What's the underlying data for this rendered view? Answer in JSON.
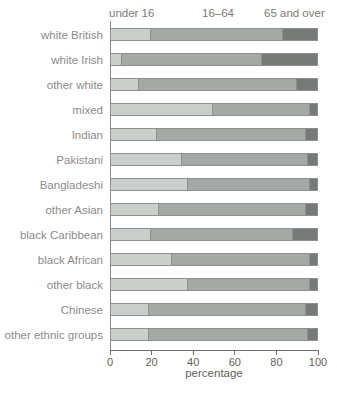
{
  "chart_data": {
    "type": "bar",
    "orientation": "horizontal",
    "stacked": true,
    "title": "",
    "xlabel": "percentage",
    "ylabel": "",
    "xlim": [
      0,
      100
    ],
    "xticks": [
      0,
      20,
      40,
      60,
      80,
      100
    ],
    "legend_position": "top",
    "grid": false,
    "categories": [
      "white British",
      "white Irish",
      "other white",
      "mixed",
      "Indian",
      "Pakistani",
      "Bangladeshi",
      "other Asian",
      "black Caribbean",
      "black African",
      "other black",
      "Chinese",
      "other ethnic groups"
    ],
    "series": [
      {
        "name": "under 16",
        "key": "under-16",
        "color": "#cbcfcb",
        "values": [
          19,
          5,
          13,
          49,
          22,
          34,
          37,
          23,
          19,
          29,
          37,
          18,
          18
        ]
      },
      {
        "name": "16–64",
        "key": "16-64",
        "color": "#a5a9a5",
        "values": [
          64,
          68,
          77,
          47,
          72,
          61,
          59,
          71,
          69,
          67,
          59,
          76,
          77
        ]
      },
      {
        "name": "65 and over",
        "key": "65-and-over",
        "color": "#767a76",
        "values": [
          17,
          27,
          10,
          4,
          6,
          5,
          4,
          6,
          12,
          4,
          4,
          6,
          5
        ]
      }
    ]
  },
  "axis": {
    "tick_labels": [
      "0",
      "20",
      "40",
      "60",
      "80",
      "100"
    ],
    "label": "percentage"
  },
  "colors": {
    "axis_line": "#6e6e66",
    "bar_border": "#8d918d",
    "category_text": "#8b8b8b",
    "legend_text": "#7b7b73"
  }
}
